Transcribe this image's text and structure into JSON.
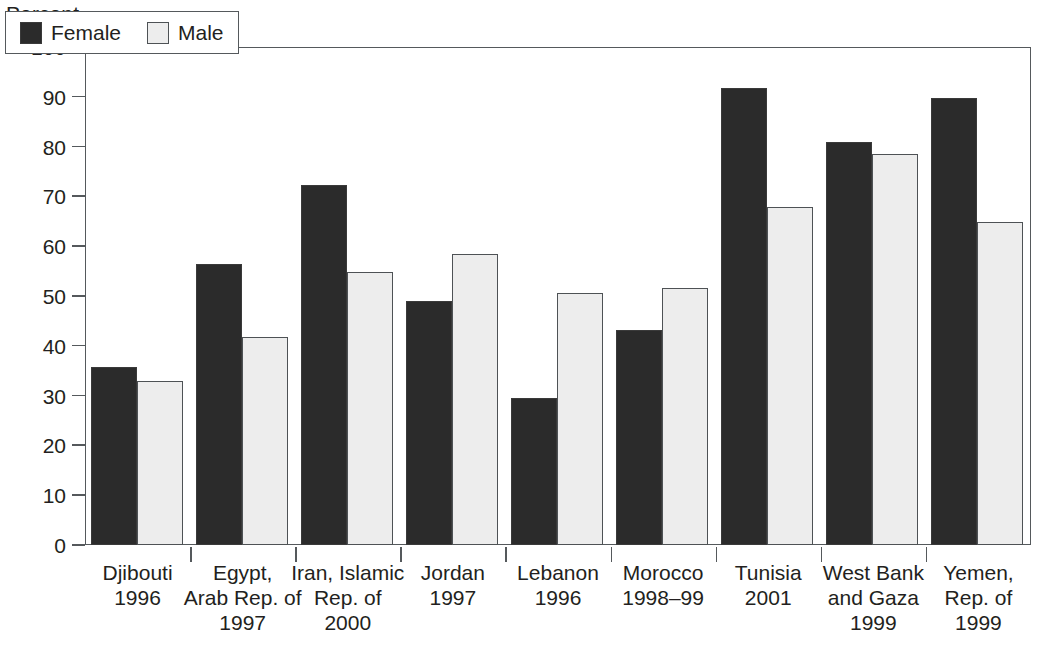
{
  "chart_data": {
    "type": "bar",
    "title": "",
    "subtitle": "",
    "ylabel": "Percent",
    "xlabel": "",
    "ylim": [
      0,
      100
    ],
    "ytick_step": 10,
    "ytick_labels": [
      "100",
      "90",
      "80",
      "70",
      "60",
      "50",
      "40",
      "30",
      "20",
      "10",
      "0"
    ],
    "ytick_values": [
      100,
      90,
      80,
      70,
      60,
      50,
      40,
      30,
      20,
      10,
      0
    ],
    "grid": false,
    "legend_position": "top-left-inside",
    "categories": [
      "Djibouti 1996",
      "Egypt, Arab Rep. of 1997",
      "Iran, Islamic Rep. of 2000",
      "Jordan 1997",
      "Lebanon 1996",
      "Morocco 1998–99",
      "Tunisia 2001",
      "West Bank and Gaza 1999",
      "Yemen, Rep. of 1999"
    ],
    "category_label_lines": [
      [
        "Djibouti",
        "1996"
      ],
      [
        "Egypt,",
        "Arab Rep. of",
        "1997"
      ],
      [
        "Iran, Islamic",
        "Rep. of",
        "2000"
      ],
      [
        "Jordan",
        "1997"
      ],
      [
        "Lebanon",
        "1996"
      ],
      [
        "Morocco",
        "1998–99"
      ],
      [
        "Tunisia",
        "2001"
      ],
      [
        "West Bank",
        "and Gaza",
        "1999"
      ],
      [
        "Yemen,",
        "Rep. of",
        "1999"
      ]
    ],
    "series": [
      {
        "name": "Female",
        "color": "#2b2b2b",
        "values": [
          35.7,
          56.4,
          72.3,
          48.9,
          29.5,
          43.2,
          91.7,
          81.0,
          89.7
        ]
      },
      {
        "name": "Male",
        "color": "#ededed",
        "values": [
          33.0,
          41.7,
          54.8,
          58.4,
          50.7,
          51.6,
          67.8,
          78.6,
          64.9
        ]
      }
    ]
  },
  "legend": {
    "entries": [
      {
        "label": "Female",
        "swatch": "female"
      },
      {
        "label": "Male",
        "swatch": "male"
      }
    ]
  }
}
